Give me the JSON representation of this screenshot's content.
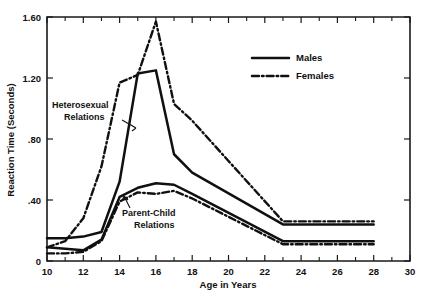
{
  "chart_data": {
    "type": "line",
    "title": "",
    "xlabel": "Age in Years",
    "ylabel": "Reaction Time (Seconds)",
    "xlim": [
      10,
      30
    ],
    "ylim": [
      0,
      1.6
    ],
    "xticks": [
      10,
      12,
      14,
      16,
      18,
      20,
      22,
      24,
      26,
      28,
      30
    ],
    "xticklabels": [
      "10",
      "12",
      "14",
      "16",
      "18",
      "20",
      "22",
      "24",
      "26",
      "28",
      "30"
    ],
    "xminorticks": [
      11,
      13,
      15,
      17,
      19,
      21,
      23,
      25,
      27,
      29
    ],
    "yticks": [
      0,
      0.4,
      0.8,
      1.2,
      1.6
    ],
    "yticklabels": [
      "0",
      ".40",
      ".80",
      "1.20",
      "1.60"
    ],
    "grid": false,
    "legend_position": "upper right",
    "legend": [
      {
        "name": "Males",
        "style": "solid"
      },
      {
        "name": "Females",
        "style": "dash-dot"
      }
    ],
    "annotations": [
      {
        "text": "Heterosexual Relations",
        "lines": [
          "Heterosexual",
          "Relations"
        ],
        "x": 13.0,
        "y": 0.93
      },
      {
        "text": "Parent-Child Relations",
        "lines": [
          "Parent-Child",
          "Relations"
        ],
        "x": 15.3,
        "y": 0.3
      }
    ],
    "series": [
      {
        "name": "Males — Heterosexual Relations",
        "sex": "Males",
        "relation": "Heterosexual Relations",
        "style": "solid",
        "x": [
          10,
          11,
          12,
          13,
          14,
          15,
          16,
          17,
          18,
          23,
          28
        ],
        "values": [
          0.15,
          0.15,
          0.16,
          0.19,
          0.52,
          1.23,
          1.25,
          0.7,
          0.58,
          0.24,
          0.24
        ]
      },
      {
        "name": "Females — Heterosexual Relations",
        "sex": "Females",
        "relation": "Heterosexual Relations",
        "style": "dash-dot",
        "x": [
          10,
          11,
          12,
          13,
          14,
          15,
          16,
          17,
          18,
          23,
          28
        ],
        "values": [
          0.09,
          0.13,
          0.28,
          0.62,
          1.17,
          1.22,
          1.57,
          1.03,
          0.92,
          0.26,
          0.26
        ]
      },
      {
        "name": "Males — Parent-Child Relations",
        "sex": "Males",
        "relation": "Parent-Child Relations",
        "style": "solid",
        "x": [
          10,
          11,
          12,
          13,
          14,
          15,
          16,
          17,
          18,
          23,
          28
        ],
        "values": [
          0.09,
          0.08,
          0.07,
          0.14,
          0.42,
          0.48,
          0.51,
          0.5,
          0.44,
          0.13,
          0.13
        ]
      },
      {
        "name": "Females — Parent-Child Relations",
        "sex": "Females",
        "relation": "Parent-Child Relations",
        "style": "dash-dot",
        "x": [
          10,
          11,
          12,
          13,
          14,
          15,
          16,
          17,
          18,
          23,
          28
        ],
        "values": [
          0.05,
          0.05,
          0.06,
          0.13,
          0.39,
          0.45,
          0.44,
          0.46,
          0.41,
          0.11,
          0.11
        ]
      }
    ],
    "colors": {
      "line": "#101010",
      "axis": "#1a1a1a",
      "background": "#ffffff"
    }
  }
}
